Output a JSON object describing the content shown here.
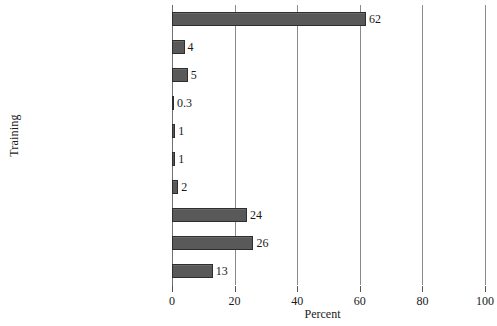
{
  "chart_data": {
    "type": "bar",
    "orientation": "horizontal",
    "title": "",
    "xlabel": "Percent",
    "ylabel": "Training",
    "xlim": [
      0,
      100
    ],
    "xticks": [
      0,
      20,
      40,
      60,
      80,
      100
    ],
    "xtick_labels": [
      "0",
      "20",
      "40",
      "60",
      "80",
      "100"
    ],
    "grid": "vertical",
    "legend": "none",
    "bar_color": "#595959",
    "bar_edge_color": "#2e2e2e",
    "categories": [
      "Clinical FP",
      "Norplant insertion",
      "Norplant counseling",
      "Clinical vasectomy",
      "Vasectomy counseling",
      "VSC",
      "VSC counseling",
      "IEC technique",
      "FP Counseling",
      "HIV/AIDS counseling"
    ],
    "values": [
      62,
      4,
      5,
      0.3,
      1,
      1,
      2,
      24,
      26,
      13
    ],
    "value_labels": [
      "62",
      "4",
      "5",
      "0.3",
      "1",
      "1",
      "2",
      "24",
      "26",
      "13"
    ]
  }
}
